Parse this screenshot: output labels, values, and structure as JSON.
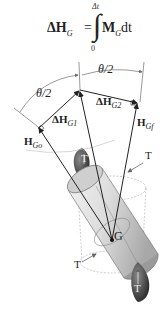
{
  "formula": {
    "lhs": "ΔH",
    "lhs_sub": "G",
    "equals": "=",
    "upper_limit": "Δt",
    "lower_limit": "0",
    "integral": "∫",
    "rhs_bold": "M",
    "rhs_sub": "G",
    "rhs_tail": "dt"
  },
  "labels": {
    "theta_left": "θ/2",
    "theta_right": "θ/2",
    "dH1": "ΔH",
    "dH1_sub": "G1",
    "dH2": "ΔH",
    "dH2_sub": "G2",
    "Hgo": "H",
    "Hgo_sub": "Go",
    "Hgf": "H",
    "Hgf_sub": "Gf",
    "G": "G",
    "T_top_left": "T",
    "T_top_right": "T",
    "T_bottom_left": "T",
    "T_bottom_right": "T"
  },
  "colors": {
    "line": "#222222",
    "arc": "#555555",
    "cylinder_light": "#e4e4e4",
    "cylinder_dark": "#9a9a9a",
    "thruster_dark": "#2c2c2c"
  }
}
